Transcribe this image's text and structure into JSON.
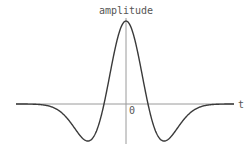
{
  "diagram": {
    "y_label": "amplitude",
    "x_label": "t",
    "origin_label": "0",
    "colors": {
      "curve": "#3a3a3a",
      "axis": "#9a9a9a",
      "text": "#555555",
      "background": "#ffffff"
    }
  },
  "chart_data": {
    "type": "line",
    "title": "",
    "xlabel": "t",
    "ylabel": "amplitude",
    "function": "(1 - 2*(pi*f*t)^2) * exp(-(pi*f*t)^2)",
    "grid": false,
    "features": {
      "peak": {
        "t": 0,
        "amplitude": 1.0
      },
      "minima_amplitude": -0.446,
      "zero_crossings": "symmetric about t=0"
    }
  }
}
